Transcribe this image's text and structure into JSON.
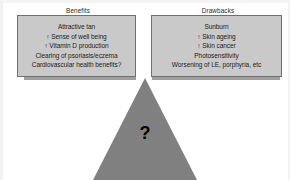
{
  "figure": {
    "type": "balance-scale-diagram",
    "question_mark": "?",
    "colors": {
      "pan_fill": "#c9c9c9",
      "pan_border": "#6f6f6f",
      "beam": "#9e9e9e",
      "fulcrum": "#808080",
      "text": "#1c1c1c",
      "background": "#ffffff"
    }
  },
  "left_pan": {
    "title": "Benefits",
    "items": [
      "Attractive tan",
      "↑ Sense of well being",
      "↑ Vitamin D production",
      "Clearing of psoriasis/eczema",
      "Cardiovascular health benefits?"
    ]
  },
  "right_pan": {
    "title": "Drawbacks",
    "items": [
      "Sunburn",
      "↑ Skin ageing",
      "↑ Skin cancer",
      "Photosensitivity",
      "Worsening of LE, porphyria, etc"
    ]
  }
}
